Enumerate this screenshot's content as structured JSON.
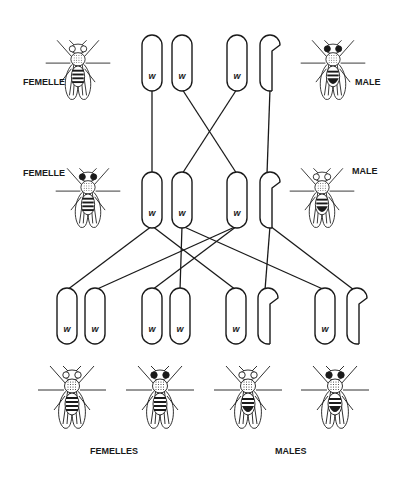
{
  "colors": {
    "ink": "#1a1a1a",
    "paper": "#ffffff"
  },
  "labels": {
    "parent_female_top": "FEMELLE",
    "parent_male_top": "MALE",
    "f1_female": "FEMELLE",
    "f1_male": "MALE",
    "offspring_females": "FEMELLES",
    "offspring_males": "MALES"
  },
  "allele_symbol": "w",
  "generations": [
    {
      "name": "parents",
      "chromosomes": [
        {
          "id": "P-F-X1",
          "type": "X",
          "allele": "w"
        },
        {
          "id": "P-F-X2",
          "type": "X",
          "allele": "w"
        },
        {
          "id": "P-M-X",
          "type": "X",
          "allele": "w"
        },
        {
          "id": "P-M-Y",
          "type": "Y",
          "allele": ""
        }
      ]
    },
    {
      "name": "F1",
      "chromosomes": [
        {
          "id": "F1-F-X1",
          "type": "X",
          "allele": "w"
        },
        {
          "id": "F1-F-X2",
          "type": "X",
          "allele": "w"
        },
        {
          "id": "F1-M-X",
          "type": "X",
          "allele": "w"
        },
        {
          "id": "F1-M-Y",
          "type": "Y",
          "allele": ""
        }
      ]
    },
    {
      "name": "F2",
      "chromosomes": [
        {
          "id": "F2-1a",
          "type": "X",
          "allele": "w"
        },
        {
          "id": "F2-1b",
          "type": "X",
          "allele": "w"
        },
        {
          "id": "F2-2a",
          "type": "X",
          "allele": "w"
        },
        {
          "id": "F2-2b",
          "type": "X",
          "allele": "w"
        },
        {
          "id": "F2-3a",
          "type": "X",
          "allele": "w"
        },
        {
          "id": "F2-3b",
          "type": "Y",
          "allele": ""
        },
        {
          "id": "F2-4a",
          "type": "X",
          "allele": "w"
        },
        {
          "id": "F2-4b",
          "type": "Y",
          "allele": ""
        }
      ]
    }
  ],
  "connections": [
    [
      "P-F-X1",
      "F1-F-X1"
    ],
    [
      "P-F-X2",
      "F1-M-X"
    ],
    [
      "P-M-X",
      "F1-F-X2"
    ],
    [
      "P-M-Y",
      "F1-M-Y"
    ],
    [
      "F1-F-X1",
      "F2-1a"
    ],
    [
      "F1-F-X1",
      "F2-3a"
    ],
    [
      "F1-F-X2",
      "F2-2b"
    ],
    [
      "F1-F-X2",
      "F2-4a"
    ],
    [
      "F1-M-X",
      "F2-1b"
    ],
    [
      "F1-M-X",
      "F2-2a"
    ],
    [
      "F1-M-Y",
      "F2-3b"
    ],
    [
      "F1-M-Y",
      "F2-4b"
    ]
  ],
  "flies": [
    {
      "id": "parent-female",
      "sex": "female",
      "eye": "white"
    },
    {
      "id": "parent-male",
      "sex": "male",
      "eye": "red"
    },
    {
      "id": "f1-female",
      "sex": "female",
      "eye": "red"
    },
    {
      "id": "f1-male",
      "sex": "male",
      "eye": "white"
    },
    {
      "id": "f2-female-1",
      "sex": "female",
      "eye": "white"
    },
    {
      "id": "f2-female-2",
      "sex": "female",
      "eye": "red"
    },
    {
      "id": "f2-male-1",
      "sex": "male",
      "eye": "white"
    },
    {
      "id": "f2-male-2",
      "sex": "male",
      "eye": "red"
    }
  ]
}
